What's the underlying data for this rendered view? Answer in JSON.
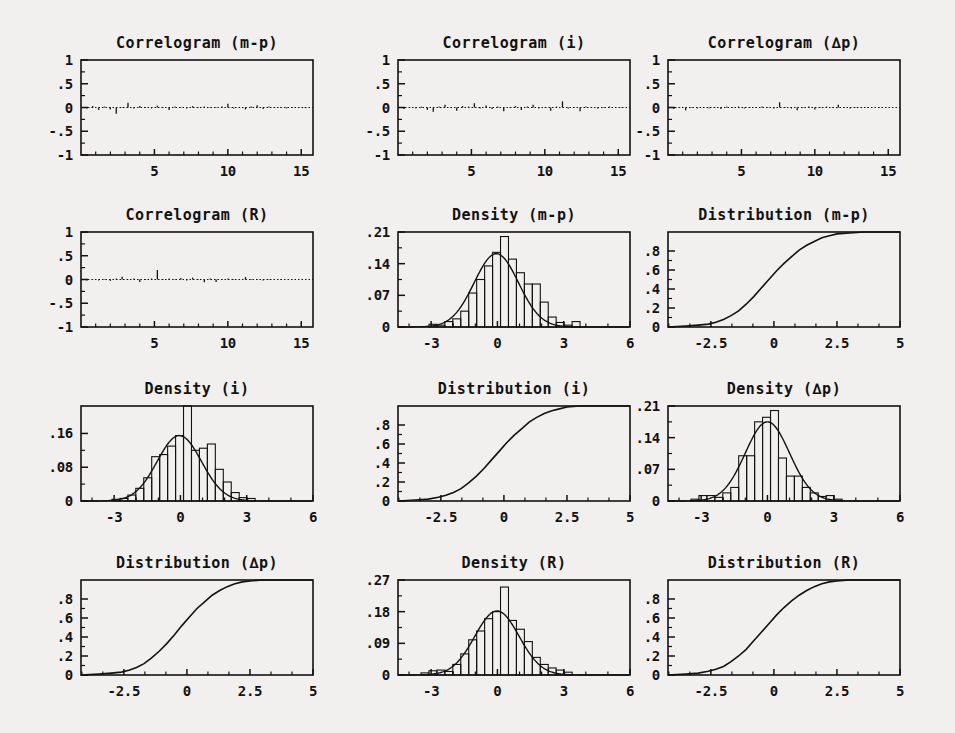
{
  "figure": {
    "background_color": "#f1f0ee",
    "ink_color": "#121212",
    "rows": 4,
    "cols": 3,
    "panel_count": 12
  },
  "chart_data": [
    {
      "type": "line",
      "subtype": "correlogram",
      "title": "Correlogram (m-p)",
      "xlabel": "",
      "ylabel": "",
      "xlim": [
        0,
        15.8
      ],
      "ylim": [
        -1,
        1
      ],
      "xticks": [
        5,
        10,
        15
      ],
      "xticklabels": [
        "5",
        "10",
        "15"
      ],
      "yticks": [
        -1,
        -0.5,
        0,
        0.5,
        1
      ],
      "yticklabels": [
        "-1",
        "-.5",
        "0",
        ".5",
        "1"
      ],
      "grid": false,
      "legend": null,
      "reference_line": 0,
      "lags": [
        0.4,
        0.8,
        1.2,
        1.6,
        2.0,
        2.4,
        2.8,
        3.2,
        3.6,
        4.0,
        4.4,
        4.8,
        5.2,
        5.6,
        6.0,
        6.4,
        6.8,
        7.2,
        7.6,
        8.0,
        8.4,
        8.8,
        9.2,
        9.6,
        10.0,
        10.4,
        10.8,
        11.2,
        11.6,
        12.0,
        12.4,
        12.8,
        13.2,
        13.6,
        14.0,
        14.4,
        14.8,
        15.2,
        15.6
      ],
      "values": [
        -0.02,
        0.03,
        -0.05,
        0.02,
        -0.04,
        -0.13,
        0.01,
        0.1,
        -0.02,
        0.03,
        0.01,
        -0.02,
        0.04,
        -0.01,
        -0.05,
        0.02,
        0.01,
        -0.02,
        0.03,
        -0.01,
        0.02,
        -0.01,
        0.01,
        0.02,
        0.08,
        -0.02,
        0.01,
        -0.04,
        0.02,
        0.05,
        -0.03,
        0.02,
        -0.01,
        0.01,
        -0.02,
        0.01,
        0.01,
        -0.01,
        0.0
      ]
    },
    {
      "type": "line",
      "subtype": "correlogram",
      "title": "Correlogram (i)",
      "xlabel": "",
      "ylabel": "",
      "xlim": [
        0,
        15.8
      ],
      "ylim": [
        -1,
        1
      ],
      "xticks": [
        5,
        10,
        15
      ],
      "xticklabels": [
        "5",
        "10",
        "15"
      ],
      "yticks": [
        -1,
        -0.5,
        0,
        0.5,
        1
      ],
      "yticklabels": [
        "-1",
        "-.5",
        "0",
        ".5",
        "1"
      ],
      "grid": false,
      "legend": null,
      "reference_line": 0,
      "lags": [
        0.4,
        0.8,
        1.2,
        1.6,
        2.0,
        2.4,
        2.8,
        3.2,
        3.6,
        4.0,
        4.4,
        4.8,
        5.2,
        5.6,
        6.0,
        6.4,
        6.8,
        7.2,
        7.6,
        8.0,
        8.4,
        8.8,
        9.2,
        9.6,
        10.0,
        10.4,
        10.8,
        11.2,
        11.6,
        12.0,
        12.4,
        12.8,
        13.2,
        13.6,
        14.0,
        14.4,
        14.8,
        15.2,
        15.6
      ],
      "values": [
        -0.03,
        0.01,
        -0.02,
        0.02,
        -0.05,
        -0.09,
        0.02,
        0.06,
        0.01,
        -0.07,
        0.03,
        0.02,
        0.09,
        -0.02,
        0.04,
        -0.03,
        0.02,
        -0.08,
        0.01,
        0.03,
        -0.05,
        0.02,
        0.06,
        -0.02,
        0.01,
        -0.07,
        0.02,
        0.13,
        -0.02,
        0.01,
        -0.08,
        0.02,
        0.01,
        -0.02,
        0.01,
        0.02,
        -0.01,
        0.01,
        0.0
      ]
    },
    {
      "type": "line",
      "subtype": "correlogram",
      "title": "Correlogram (∆p)",
      "xlabel": "",
      "ylabel": "",
      "xlim": [
        0,
        15.8
      ],
      "ylim": [
        -1,
        1
      ],
      "xticks": [
        5,
        10,
        15
      ],
      "xticklabels": [
        "5",
        "10",
        "15"
      ],
      "yticks": [
        -1,
        -0.5,
        0,
        0.5,
        1
      ],
      "yticklabels": [
        "-1",
        "-.5",
        "0",
        ".5",
        "1"
      ],
      "grid": false,
      "legend": null,
      "reference_line": 0,
      "lags": [
        0.4,
        0.8,
        1.2,
        1.6,
        2.0,
        2.4,
        2.8,
        3.2,
        3.6,
        4.0,
        4.4,
        4.8,
        5.2,
        5.6,
        6.0,
        6.4,
        6.8,
        7.2,
        7.6,
        8.0,
        8.4,
        8.8,
        9.2,
        9.6,
        10.0,
        10.4,
        10.8,
        11.2,
        11.6,
        12.0,
        12.4,
        12.8,
        13.2,
        13.6,
        14.0,
        14.4,
        14.8,
        15.2,
        15.6
      ],
      "values": [
        -0.03,
        0.01,
        -0.06,
        0.01,
        -0.02,
        0.01,
        -0.02,
        0.01,
        -0.03,
        0.02,
        -0.01,
        0.02,
        -0.02,
        0.01,
        -0.01,
        0.02,
        0.01,
        -0.02,
        0.11,
        0.01,
        -0.02,
        -0.06,
        0.01,
        0.02,
        -0.04,
        0.01,
        0.02,
        -0.01,
        0.06,
        0.01,
        -0.02,
        0.01,
        -0.01,
        0.01,
        0.0,
        0.01,
        0.0,
        0.0,
        0.0
      ]
    },
    {
      "type": "line",
      "subtype": "correlogram",
      "title": "Correlogram (R)",
      "xlabel": "",
      "ylabel": "",
      "xlim": [
        0,
        15.8
      ],
      "ylim": [
        -1,
        1
      ],
      "xticks": [
        5,
        10,
        15
      ],
      "xticklabels": [
        "5",
        "10",
        "15"
      ],
      "yticks": [
        -1,
        -0.5,
        0,
        0.5,
        1
      ],
      "yticklabels": [
        "-1",
        "-.5",
        "0",
        ".5",
        "1"
      ],
      "grid": false,
      "legend": null,
      "reference_line": 0,
      "lags": [
        0.4,
        0.8,
        1.2,
        1.6,
        2.0,
        2.4,
        2.8,
        3.2,
        3.6,
        4.0,
        4.4,
        4.8,
        5.2,
        5.6,
        6.0,
        6.4,
        6.8,
        7.2,
        7.6,
        8.0,
        8.4,
        8.8,
        9.2,
        9.6,
        10.0,
        10.4,
        10.8,
        11.2,
        11.6,
        12.0,
        12.4,
        12.8,
        13.2,
        13.6,
        14.0,
        14.4,
        14.8,
        15.2,
        15.6
      ],
      "values": [
        -0.02,
        0.01,
        -0.02,
        0.01,
        -0.03,
        0.02,
        0.06,
        -0.01,
        0.02,
        -0.05,
        0.01,
        0.02,
        0.2,
        -0.01,
        0.02,
        -0.01,
        0.03,
        -0.02,
        0.04,
        0.01,
        -0.06,
        0.02,
        -0.05,
        0.01,
        0.02,
        -0.01,
        0.01,
        0.05,
        -0.01,
        0.01,
        -0.02,
        0.01,
        0.0,
        0.01,
        0.0,
        0.0,
        0.0,
        0.0,
        0.0
      ]
    },
    {
      "type": "bar",
      "subtype": "histogram-with-density",
      "title": "Density (m-p)",
      "xlabel": "",
      "ylabel": "",
      "xlim": [
        -4.5,
        6
      ],
      "ylim": [
        0,
        0.21
      ],
      "xticks": [
        -3,
        0,
        3,
        6
      ],
      "xticklabels": [
        "-3",
        "0",
        "3",
        "6"
      ],
      "yticks": [
        0,
        0.07,
        0.14,
        0.21
      ],
      "yticklabels": [
        "0",
        ".07",
        ".14",
        ".21"
      ],
      "grid": false,
      "legend": null,
      "bin_width": 0.36,
      "bin_starts": [
        -3.1,
        -2.74,
        -2.38,
        -2.02,
        -1.66,
        -1.3,
        -0.94,
        -0.58,
        -0.22,
        0.14,
        0.5,
        0.86,
        1.22,
        1.58,
        1.94,
        2.3,
        2.66,
        3.02,
        3.38
      ],
      "values": [
        0.006,
        0.004,
        0.012,
        0.018,
        0.035,
        0.075,
        0.105,
        0.135,
        0.165,
        0.2,
        0.15,
        0.12,
        0.095,
        0.095,
        0.055,
        0.022,
        0.01,
        0.004,
        0.012
      ],
      "overlay_curve": {
        "name": "normal density",
        "mean": -0.05,
        "sd": 1.0,
        "peak": 0.162
      }
    },
    {
      "type": "line",
      "subtype": "empirical-cdf",
      "title": "Distribution (m-p)",
      "xlabel": "",
      "ylabel": "",
      "xlim": [
        -4.2,
        5
      ],
      "ylim": [
        0,
        1
      ],
      "xticks": [
        -2.5,
        0,
        2.5,
        5
      ],
      "xticklabels": [
        "-2.5",
        "0",
        "2.5",
        "5"
      ],
      "yticks": [
        0,
        0.2,
        0.4,
        0.6,
        0.8
      ],
      "yticklabels": [
        "0",
        ".2",
        ".4",
        ".6",
        ".8"
      ],
      "grid": false,
      "legend": null,
      "x": [
        -4.2,
        -3.5,
        -3.0,
        -2.6,
        -2.3,
        -2.0,
        -1.7,
        -1.4,
        -1.1,
        -0.8,
        -0.5,
        -0.2,
        0.1,
        0.4,
        0.7,
        1.0,
        1.3,
        1.6,
        1.9,
        2.2,
        2.5,
        3.0,
        3.6,
        4.3,
        5.0
      ],
      "values": [
        0.0,
        0.01,
        0.02,
        0.03,
        0.05,
        0.08,
        0.12,
        0.17,
        0.24,
        0.32,
        0.41,
        0.5,
        0.59,
        0.67,
        0.74,
        0.81,
        0.86,
        0.9,
        0.94,
        0.96,
        0.98,
        0.99,
        1.0,
        1.0,
        1.0
      ]
    },
    {
      "type": "bar",
      "subtype": "histogram-with-density",
      "title": "Density (i)",
      "xlabel": "",
      "ylabel": "",
      "xlim": [
        -4.5,
        6
      ],
      "ylim": [
        0,
        0.225
      ],
      "xticks": [
        -3,
        0,
        3,
        6
      ],
      "xticklabels": [
        "-3",
        "0",
        "3",
        "6"
      ],
      "yticks": [
        0,
        0.08,
        0.16
      ],
      "yticklabels": [
        "0",
        ".08",
        ".16"
      ],
      "grid": false,
      "legend": null,
      "bin_width": 0.36,
      "bin_starts": [
        -3.1,
        -2.74,
        -2.38,
        -2.02,
        -1.66,
        -1.3,
        -0.94,
        -0.58,
        -0.22,
        0.14,
        0.5,
        0.86,
        1.22,
        1.58,
        1.94,
        2.3,
        2.66,
        3.02
      ],
      "values": [
        0.004,
        0.006,
        0.014,
        0.03,
        0.055,
        0.105,
        0.11,
        0.13,
        0.155,
        0.225,
        0.12,
        0.125,
        0.135,
        0.075,
        0.045,
        0.02,
        0.008,
        0.006
      ],
      "overlay_curve": {
        "name": "normal density",
        "mean": -0.05,
        "sd": 1.0,
        "peak": 0.155
      }
    },
    {
      "type": "line",
      "subtype": "empirical-cdf",
      "title": "Distribution (i)",
      "xlabel": "",
      "ylabel": "",
      "xlim": [
        -4.2,
        5
      ],
      "ylim": [
        0,
        1
      ],
      "xticks": [
        -2.5,
        0,
        2.5,
        5
      ],
      "xticklabels": [
        "-2.5",
        "0",
        "2.5",
        "5"
      ],
      "yticks": [
        0,
        0.2,
        0.4,
        0.6,
        0.8
      ],
      "yticklabels": [
        "0",
        ".2",
        ".4",
        ".6",
        ".8"
      ],
      "grid": false,
      "legend": null,
      "x": [
        -4.2,
        -3.5,
        -3.0,
        -2.6,
        -2.3,
        -2.0,
        -1.7,
        -1.4,
        -1.1,
        -0.8,
        -0.5,
        -0.2,
        0.1,
        0.4,
        0.7,
        1.0,
        1.3,
        1.6,
        1.9,
        2.2,
        2.5,
        3.0,
        3.6,
        4.3,
        5.0
      ],
      "values": [
        0.0,
        0.01,
        0.02,
        0.04,
        0.06,
        0.09,
        0.13,
        0.19,
        0.26,
        0.34,
        0.43,
        0.52,
        0.61,
        0.69,
        0.76,
        0.83,
        0.88,
        0.92,
        0.95,
        0.97,
        0.99,
        1.0,
        1.0,
        1.0,
        1.0
      ]
    },
    {
      "type": "bar",
      "subtype": "histogram-with-density",
      "title": "Density (∆p)",
      "xlabel": "",
      "ylabel": "",
      "xlim": [
        -4.5,
        6
      ],
      "ylim": [
        0,
        0.21
      ],
      "xticks": [
        -3,
        0,
        3,
        6
      ],
      "xticklabels": [
        "-3",
        "0",
        "3",
        "6"
      ],
      "yticks": [
        0,
        0.07,
        0.14,
        0.21
      ],
      "yticklabels": [
        "0",
        ".07",
        ".14",
        ".21"
      ],
      "grid": false,
      "legend": null,
      "bin_width": 0.36,
      "bin_starts": [
        -3.46,
        -3.1,
        -2.74,
        -2.38,
        -2.02,
        -1.66,
        -1.3,
        -0.94,
        -0.58,
        -0.22,
        0.14,
        0.5,
        0.86,
        1.22,
        1.58,
        1.94,
        2.3,
        2.66,
        3.02
      ],
      "values": [
        0.004,
        0.012,
        0.012,
        0.008,
        0.018,
        0.03,
        0.1,
        0.1,
        0.175,
        0.185,
        0.2,
        0.095,
        0.055,
        0.055,
        0.03,
        0.018,
        0.01,
        0.012,
        0.004
      ],
      "overlay_curve": {
        "name": "normal density",
        "mean": 0.0,
        "sd": 1.0,
        "peak": 0.175
      }
    },
    {
      "type": "line",
      "subtype": "empirical-cdf",
      "title": "Distribution (∆p)",
      "xlabel": "",
      "ylabel": "",
      "xlim": [
        -4.2,
        5
      ],
      "ylim": [
        0,
        1
      ],
      "xticks": [
        -2.5,
        0,
        2.5,
        5
      ],
      "xticklabels": [
        "-2.5",
        "0",
        "2.5",
        "5"
      ],
      "yticks": [
        0,
        0.2,
        0.4,
        0.6,
        0.8
      ],
      "yticklabels": [
        "0",
        ".2",
        ".4",
        ".6",
        ".8"
      ],
      "grid": false,
      "legend": null,
      "x": [
        -4.2,
        -3.5,
        -3.0,
        -2.6,
        -2.3,
        -2.0,
        -1.7,
        -1.4,
        -1.1,
        -0.8,
        -0.5,
        -0.2,
        0.1,
        0.4,
        0.7,
        1.0,
        1.3,
        1.6,
        1.9,
        2.2,
        2.5,
        3.0,
        3.6,
        4.3,
        5.0
      ],
      "values": [
        0.0,
        0.01,
        0.02,
        0.03,
        0.05,
        0.08,
        0.12,
        0.18,
        0.25,
        0.33,
        0.42,
        0.52,
        0.61,
        0.7,
        0.77,
        0.84,
        0.89,
        0.93,
        0.96,
        0.98,
        0.99,
        1.0,
        1.0,
        1.0,
        1.0
      ]
    },
    {
      "type": "bar",
      "subtype": "histogram-with-density",
      "title": "Density (R)",
      "xlabel": "",
      "ylabel": "",
      "xlim": [
        -4.5,
        6
      ],
      "ylim": [
        0,
        0.27
      ],
      "xticks": [
        -3,
        0,
        3,
        6
      ],
      "xticklabels": [
        "-3",
        "0",
        "3",
        "6"
      ],
      "yticks": [
        0,
        0.09,
        0.18,
        0.27
      ],
      "yticklabels": [
        "0",
        ".09",
        ".18",
        ".27"
      ],
      "grid": false,
      "legend": null,
      "bin_width": 0.36,
      "bin_starts": [
        -3.46,
        -3.1,
        -2.74,
        -2.38,
        -2.02,
        -1.66,
        -1.3,
        -0.94,
        -0.58,
        -0.22,
        0.14,
        0.5,
        0.86,
        1.22,
        1.58,
        1.94,
        2.3,
        2.66,
        3.02
      ],
      "values": [
        0.006,
        0.012,
        0.014,
        0.01,
        0.03,
        0.06,
        0.1,
        0.125,
        0.16,
        0.18,
        0.25,
        0.155,
        0.13,
        0.095,
        0.05,
        0.03,
        0.02,
        0.014,
        0.008
      ],
      "overlay_curve": {
        "name": "normal density",
        "mean": -0.02,
        "sd": 1.0,
        "peak": 0.182
      }
    },
    {
      "type": "line",
      "subtype": "empirical-cdf",
      "title": "Distribution (R)",
      "xlabel": "",
      "ylabel": "",
      "xlim": [
        -4.2,
        5
      ],
      "ylim": [
        0,
        1
      ],
      "xticks": [
        -2.5,
        0,
        2.5,
        5
      ],
      "xticklabels": [
        "-2.5",
        "0",
        "2.5",
        "5"
      ],
      "yticks": [
        0,
        0.2,
        0.4,
        0.6,
        0.8
      ],
      "yticklabels": [
        "0",
        ".2",
        ".4",
        ".6",
        ".8"
      ],
      "grid": false,
      "legend": null,
      "x": [
        -4.2,
        -3.5,
        -3.0,
        -2.6,
        -2.3,
        -2.0,
        -1.7,
        -1.4,
        -1.1,
        -0.8,
        -0.5,
        -0.2,
        0.1,
        0.4,
        0.7,
        1.0,
        1.3,
        1.6,
        1.9,
        2.2,
        2.5,
        3.0,
        3.6,
        4.3,
        5.0
      ],
      "values": [
        0.0,
        0.01,
        0.02,
        0.04,
        0.06,
        0.09,
        0.14,
        0.2,
        0.27,
        0.36,
        0.45,
        0.54,
        0.63,
        0.71,
        0.78,
        0.84,
        0.89,
        0.93,
        0.96,
        0.98,
        0.99,
        1.0,
        1.0,
        1.0,
        1.0
      ]
    }
  ]
}
